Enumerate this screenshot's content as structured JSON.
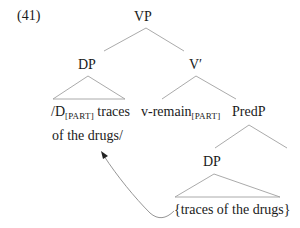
{
  "example_number": "(41)",
  "nodes": {
    "vp": "VP",
    "dp_top": "DP",
    "v_bar": "V′",
    "predp": "PredP",
    "dp_low": "DP"
  },
  "leaves": {
    "dp_top_line1_a": "/D",
    "dp_top_line1_sub": "[PART]",
    "dp_top_line1_b": " traces",
    "dp_top_line2": "of the drugs/",
    "v_a": "v-remain",
    "v_sub": "[PART]",
    "dp_low_text": "{traces of the drugs}"
  },
  "colors": {
    "line": "#9a9a9a",
    "text": "#1a1a1a",
    "arrow": "#8a8a8a"
  }
}
